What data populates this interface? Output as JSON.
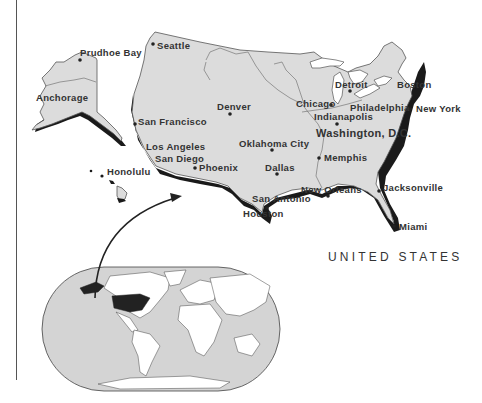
{
  "title": "UNITED STATES",
  "colors": {
    "land": "#dcdcdc",
    "coast_shadow": "#1a1a1a",
    "ocean_inset": "#d4d4d4",
    "highlight_country": "#222222",
    "text": "#333333"
  },
  "cities": [
    {
      "name": "Prudhoe Bay",
      "x": 80,
      "y": 53
    },
    {
      "name": "Seattle",
      "x": 152,
      "y": 48
    },
    {
      "name": "Anchorage",
      "x": 36,
      "y": 99
    },
    {
      "name": "Denver",
      "x": 217,
      "y": 108
    },
    {
      "name": "San Francisco",
      "x": 137,
      "y": 123
    },
    {
      "name": "Los Angeles",
      "x": 146,
      "y": 148
    },
    {
      "name": "San Diego",
      "x": 154,
      "y": 160
    },
    {
      "name": "Phoenix",
      "x": 196,
      "y": 169
    },
    {
      "name": "Honolulu",
      "x": 108,
      "y": 172
    },
    {
      "name": "Oklahoma City",
      "x": 239,
      "y": 139
    },
    {
      "name": "Dallas",
      "x": 265,
      "y": 164
    },
    {
      "name": "San Antonio",
      "x": 252,
      "y": 198
    },
    {
      "name": "Houston",
      "x": 243,
      "y": 210
    },
    {
      "name": "Chicago",
      "x": 296,
      "y": 101
    },
    {
      "name": "Detroit",
      "x": 335,
      "y": 82
    },
    {
      "name": "Indianapolis",
      "x": 314,
      "y": 114
    },
    {
      "name": "Philadelphia",
      "x": 350,
      "y": 105
    },
    {
      "name": "New York",
      "x": 416,
      "y": 106
    },
    {
      "name": "Boston",
      "x": 397,
      "y": 82
    },
    {
      "name": "Washington, D.C.",
      "x": 316,
      "y": 128
    },
    {
      "name": "Memphis",
      "x": 324,
      "y": 152
    },
    {
      "name": "New Orleans",
      "x": 301,
      "y": 186
    },
    {
      "name": "Jacksonville",
      "x": 384,
      "y": 184
    },
    {
      "name": "Miami",
      "x": 400,
      "y": 224
    }
  ],
  "inset": {
    "label": "World locator map",
    "highlighted_country": "United States"
  }
}
